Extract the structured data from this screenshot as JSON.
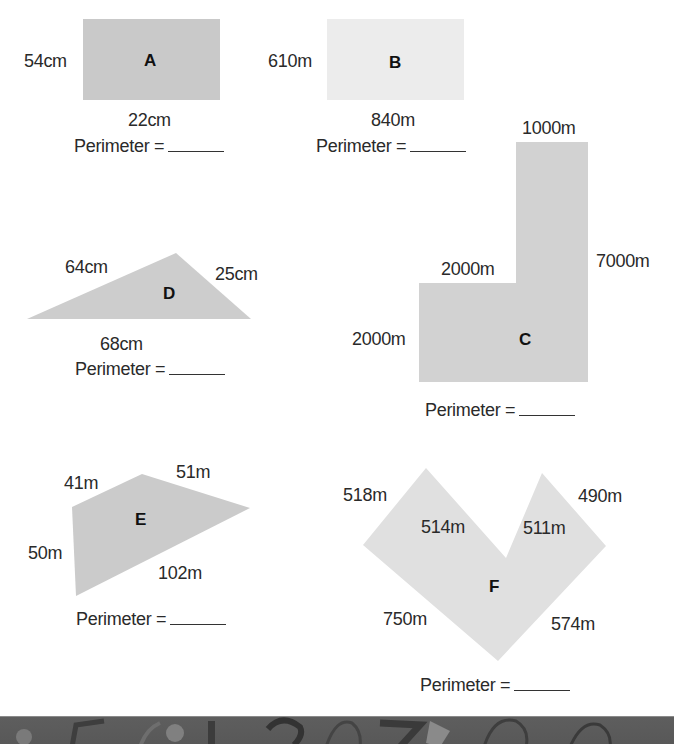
{
  "worksheet": {
    "perimeter_prompt": "Perimeter =",
    "colors": {
      "shape_fill": "#c9c9c9",
      "shape_b_fill": "#ececec",
      "shape_light_fill": "#dedede",
      "text": "#2a2a2a",
      "footer": "#5c5c5c"
    },
    "shapes": {
      "A": {
        "letter": "A",
        "type": "rectangle",
        "side_label": "54cm",
        "bottom_label": "22cm"
      },
      "B": {
        "letter": "B",
        "type": "rectangle",
        "side_label": "610m",
        "bottom_label": "840m"
      },
      "C": {
        "letter": "C",
        "type": "L-shape",
        "labels": {
          "top": "1000m",
          "right": "7000m",
          "inner_top": "2000m",
          "left": "2000m"
        }
      },
      "D": {
        "letter": "D",
        "type": "triangle",
        "labels": {
          "left": "64cm",
          "right": "25cm",
          "bottom": "68cm"
        }
      },
      "E": {
        "letter": "E",
        "type": "quadrilateral",
        "labels": {
          "top_left": "41m",
          "top_right": "51m",
          "left": "50m",
          "bottom": "102m"
        }
      },
      "F": {
        "letter": "F",
        "type": "V-shape",
        "labels": {
          "outer_left": "518m",
          "inner_left": "514m",
          "inner_right": "511m",
          "outer_right": "490m",
          "bottom_left": "750m",
          "bottom_right": "574m"
        }
      }
    },
    "footer_digits": "5 6 1 2 0 7 0 0"
  }
}
